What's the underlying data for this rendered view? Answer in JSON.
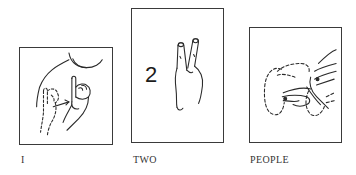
{
  "figure": {
    "cards": [
      {
        "id": "i",
        "caption": "I",
        "illustration": "sign-I-hand-at-chest",
        "numeral": null
      },
      {
        "id": "two",
        "caption": "TWO",
        "illustration": "sign-two-v-hand",
        "numeral": "2"
      },
      {
        "id": "people",
        "caption": "PEOPLE",
        "illustration": "sign-people-circling-hands",
        "numeral": null
      }
    ]
  },
  "colors": {
    "border": "#3a3a3a",
    "ink": "#2a2a2a",
    "background": "#ffffff"
  }
}
